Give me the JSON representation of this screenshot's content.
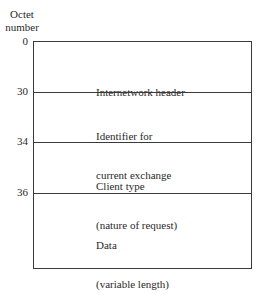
{
  "diagram": {
    "axis_title_line1": "Octet",
    "axis_title_line2": "number",
    "fields": [
      {
        "offset": "0",
        "line1": "Internetwork header",
        "line2": ""
      },
      {
        "offset": "30",
        "line1": "Identifier for",
        "line2": "current exchange"
      },
      {
        "offset": "34",
        "line1": "Client type",
        "line2": "(nature of request)"
      },
      {
        "offset": "36",
        "line1": "Data",
        "line2": "(variable length)"
      }
    ],
    "colors": {
      "line": "#3a3a3a",
      "text": "#2a2a2a",
      "background": "#ffffff"
    }
  }
}
